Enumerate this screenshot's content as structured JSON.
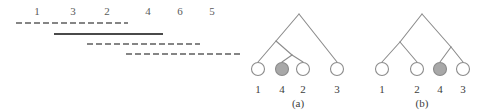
{
  "figure": {
    "width": 484,
    "height": 112,
    "background": "#ffffff"
  },
  "interval_panel": {
    "name": "interval-diagram",
    "tick_labels": [
      {
        "text": "1",
        "x": 37,
        "y": 6
      },
      {
        "text": "3",
        "x": 73,
        "y": 6
      },
      {
        "text": "2",
        "x": 107,
        "y": 6
      },
      {
        "text": "4",
        "x": 148,
        "y": 6
      },
      {
        "text": "6",
        "x": 180,
        "y": 6
      },
      {
        "text": "5",
        "x": 212,
        "y": 6
      }
    ],
    "segments": [
      {
        "name": "segment-1",
        "style": "dashed",
        "x1": 16,
        "x2": 128,
        "y": 23,
        "color": "#5e5e5e",
        "thickness": 1.6
      },
      {
        "name": "segment-2",
        "style": "solid",
        "x1": 54,
        "x2": 163,
        "y": 34,
        "color": "#4a4a4a",
        "thickness": 2.2
      },
      {
        "name": "segment-3",
        "style": "dashed",
        "x1": 87,
        "x2": 200,
        "y": 44,
        "color": "#5e5e5e",
        "thickness": 1.6
      },
      {
        "name": "segment-4",
        "style": "dashed",
        "x1": 126,
        "x2": 240,
        "y": 54,
        "color": "#5e5e5e",
        "thickness": 1.6
      }
    ]
  },
  "tree_a": {
    "name": "tree-a",
    "caption": "(a)",
    "caption_x": 298,
    "caption_y": 98,
    "stroke": "#8c8c8c",
    "leaves": [
      {
        "label": "1",
        "cx": 258,
        "cy": 69,
        "r": 6.5,
        "filled": false
      },
      {
        "label": "4",
        "cx": 282,
        "cy": 69,
        "r": 6.5,
        "filled": true
      },
      {
        "label": "2",
        "cx": 303,
        "cy": 69,
        "r": 6.5,
        "filled": false
      },
      {
        "label": "3",
        "cx": 337,
        "cy": 69,
        "r": 6.5,
        "filled": false
      }
    ],
    "internal_nodes": [
      {
        "name": "root",
        "cx": 299,
        "cy": 14
      },
      {
        "name": "clade-124",
        "cx": 276,
        "cy": 41
      },
      {
        "name": "clade-42",
        "cx": 292,
        "cy": 55
      }
    ],
    "edges": [
      {
        "x1": 299,
        "y1": 14,
        "x2": 276,
        "y2": 41
      },
      {
        "x1": 299,
        "y1": 14,
        "x2": 337,
        "y2": 62
      },
      {
        "x1": 276,
        "y1": 41,
        "x2": 258,
        "y2": 62
      },
      {
        "x1": 276,
        "y1": 41,
        "x2": 292,
        "y2": 55
      },
      {
        "x1": 292,
        "y1": 55,
        "x2": 282,
        "y2": 62
      },
      {
        "x1": 292,
        "y1": 55,
        "x2": 303,
        "y2": 62
      }
    ],
    "label_y": 84
  },
  "tree_b": {
    "name": "tree-b",
    "caption": "(b)",
    "caption_x": 422,
    "caption_y": 98,
    "stroke": "#8c8c8c",
    "leaves": [
      {
        "label": "1",
        "cx": 382,
        "cy": 69,
        "r": 6.5,
        "filled": false
      },
      {
        "label": "2",
        "cx": 417,
        "cy": 69,
        "r": 6.5,
        "filled": false
      },
      {
        "label": "4",
        "cx": 440,
        "cy": 69,
        "r": 6.5,
        "filled": true
      },
      {
        "label": "3",
        "cx": 463,
        "cy": 69,
        "r": 6.5,
        "filled": false
      }
    ],
    "internal_nodes": [
      {
        "name": "root",
        "cx": 422,
        "cy": 14
      },
      {
        "name": "clade-12",
        "cx": 400,
        "cy": 42
      },
      {
        "name": "clade-43",
        "cx": 451,
        "cy": 47
      }
    ],
    "edges": [
      {
        "x1": 422,
        "y1": 14,
        "x2": 400,
        "y2": 42
      },
      {
        "x1": 422,
        "y1": 14,
        "x2": 451,
        "y2": 47
      },
      {
        "x1": 400,
        "y1": 42,
        "x2": 382,
        "y2": 62
      },
      {
        "x1": 400,
        "y1": 42,
        "x2": 417,
        "y2": 62
      },
      {
        "x1": 451,
        "y1": 47,
        "x2": 440,
        "y2": 62
      },
      {
        "x1": 451,
        "y1": 47,
        "x2": 463,
        "y2": 62
      }
    ],
    "label_y": 84
  },
  "colors": {
    "filled_node_fill": "#a8a8a8",
    "filled_node_stroke": "#8a8a8a",
    "open_node_fill": "#ffffff",
    "open_node_stroke": "#8c8c8c",
    "edge": "#8c8c8c",
    "dashed_segment": "#5e5e5e",
    "solid_segment": "#4a4a4a",
    "tick_text": "#5a5a5a",
    "label_text": "#3d3d3d"
  }
}
